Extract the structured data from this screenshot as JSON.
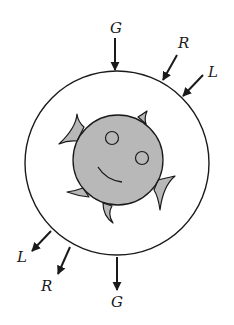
{
  "diagram": {
    "colors": {
      "stroke": "#1a1a1a",
      "fish_fill": "#b8b8b8",
      "background": "#ffffff",
      "vessel_fill": "#ffffff"
    },
    "labels": {
      "top_gravity": "G",
      "top_right_r": "R",
      "top_right_l": "L",
      "bottom_left_l": "L",
      "bottom_left_r": "R",
      "bottom_gravity": "G"
    },
    "vessel": {
      "cx": 117,
      "cy": 163,
      "r": 92
    },
    "fish": {
      "cx": 118,
      "cy": 160,
      "r": 45
    }
  }
}
